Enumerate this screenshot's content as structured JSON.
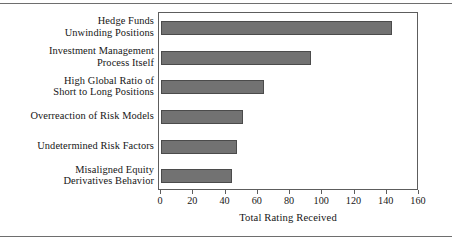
{
  "figure": {
    "background_color": "#ffffff",
    "frame_color": "#5d5d5d",
    "rule_color": "#6e6e6e",
    "bar_color": "#727272",
    "bar_edge_color": "#4b4b4b"
  },
  "chart_data": {
    "type": "bar",
    "orientation": "horizontal",
    "title": "",
    "xlabel": "Total Rating Received",
    "ylabel": "",
    "xlim": [
      0,
      160
    ],
    "ylim": [
      0,
      6
    ],
    "grid": false,
    "legend": null,
    "xticks": [
      0,
      20,
      40,
      60,
      80,
      100,
      120,
      140,
      160
    ],
    "xticklabels": [
      "0",
      "20",
      "40",
      "60",
      "80",
      "100",
      "120",
      "140",
      "160"
    ],
    "categories": [
      "Hedge Funds\nUnwinding Positions",
      "Investment Management\nProcess Itself",
      "High Global Ratio of\nShort to Long Positions",
      "Overreaction of Risk Models",
      "Undetermined Risk Factors",
      "Misaligned Equity\nDerivatives Behavior"
    ],
    "values": [
      143,
      93,
      64,
      51,
      47,
      44
    ]
  }
}
